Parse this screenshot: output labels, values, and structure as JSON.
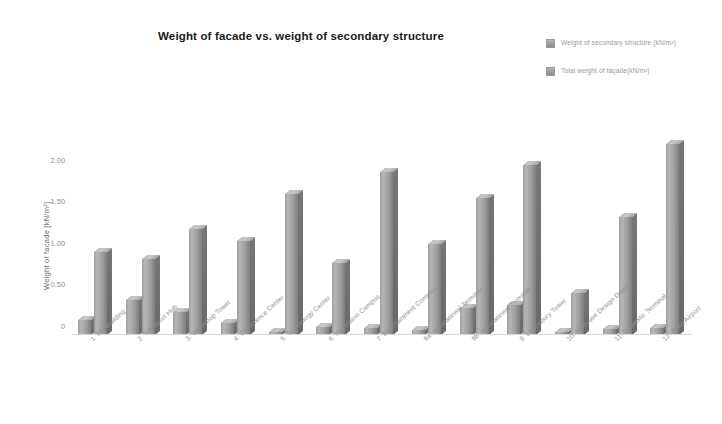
{
  "chart_data": {
    "type": "bar",
    "title": "Weight of facade vs. weight of secondary structure",
    "xlabel": "",
    "ylabel": "Weight of facade [kN/m²]",
    "ylim": [
      0,
      2.5
    ],
    "yticks": [
      "0",
      "0.50",
      "1.00",
      "1.50",
      "2.00"
    ],
    "ytick_values": [
      0,
      0.5,
      1.0,
      1.5,
      2.0
    ],
    "grid": false,
    "legend_position": "top-right",
    "categories": [
      "1. HQ Building",
      "2. Transport Hub",
      "3. Workshop Tower",
      "4. Conference Center",
      "5. Technology Center",
      "6. Innovation Campus",
      "7. Entertainment Complex",
      "8a. International Terminal",
      "8b. International Terminal",
      "9. Laboratory Tower",
      "10. Multi-use Design District",
      "11. Domestic Terminal",
      "12. Baku Airport"
    ],
    "series": [
      {
        "name": "Weight of secondary structure (kN/m²)",
        "values": [
          0.18,
          0.42,
          0.28,
          0.14,
          0.02,
          0.1,
          0.08,
          0.06,
          0.33,
          0.36,
          0.02,
          0.07,
          0.09
        ]
      },
      {
        "name": "Total weight of façade(kN/m²)",
        "values": [
          1.0,
          0.92,
          1.28,
          1.13,
          1.7,
          0.87,
          1.96,
          1.09,
          1.65,
          2.05,
          0.5,
          1.42,
          2.3
        ]
      }
    ]
  },
  "legend": {
    "items": [
      {
        "label": "Weight of secondary structure (kN/m²)"
      },
      {
        "label": "Total weight of façade(kN/m²)"
      }
    ]
  },
  "colors": {
    "bar_light": "#b6b6b6",
    "bar_mid": "#a0a0a0",
    "bar_dark": "#7e7e7e",
    "axis": "#d8d8d8",
    "tick_text": "#8d8d8d",
    "label_text": "#8f8f8f",
    "title_text": "#1a1a1a",
    "background": "#ffffff"
  }
}
